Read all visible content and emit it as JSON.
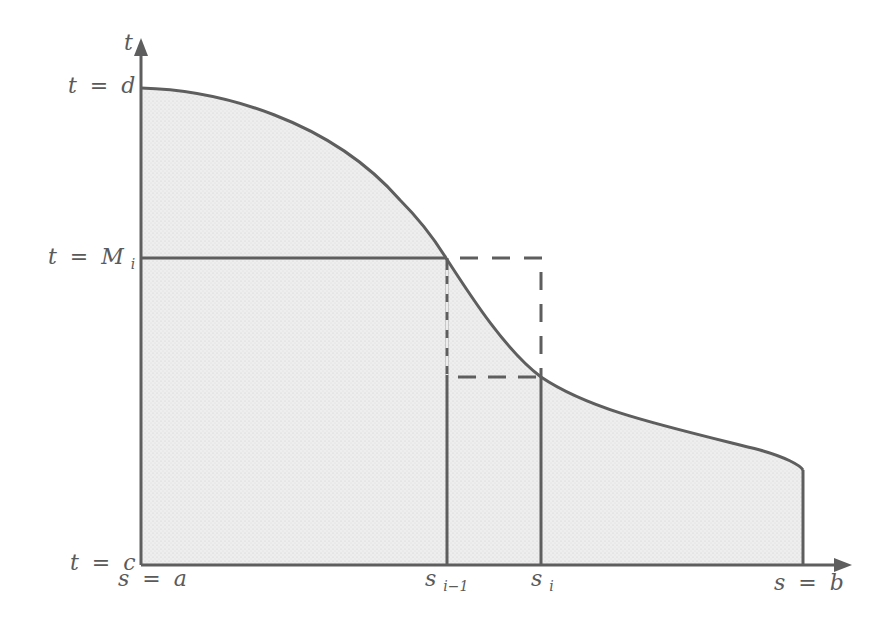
{
  "figure": {
    "type": "region-under-curve diagram",
    "colors": {
      "stroke": "#5e5e5e",
      "fill": "#ececec",
      "label": "#5a5a5a",
      "background": "#ffffff"
    },
    "axes": {
      "vertical_axis_label": "t",
      "horizontal_axis_arrow": true,
      "vertical_axis_arrow": true
    },
    "labels": {
      "t_top": {
        "var": "t",
        "eq": "=",
        "val": "d"
      },
      "t_mid": {
        "var": "t",
        "eq": "=",
        "val": "M",
        "sub": "i"
      },
      "t_bottom": {
        "var": "t",
        "eq": "=",
        "val": "c"
      },
      "s_left": {
        "var": "s",
        "eq": "=",
        "val": "a"
      },
      "s_im1": {
        "val": "s",
        "sub": "i−1"
      },
      "s_i": {
        "val": "s",
        "sub": "i"
      },
      "s_right": {
        "var": "s",
        "eq": "=",
        "val": "b"
      }
    },
    "elements": [
      "shaded region under decreasing curve from s=a to s=b",
      "horizontal solid line at t=M_i from axis to s_{i-1}",
      "vertical solid lines at s_{i-1} and s_i down to axis",
      "dashed rectangle from s_{i-1} to s_i between curve values"
    ]
  }
}
